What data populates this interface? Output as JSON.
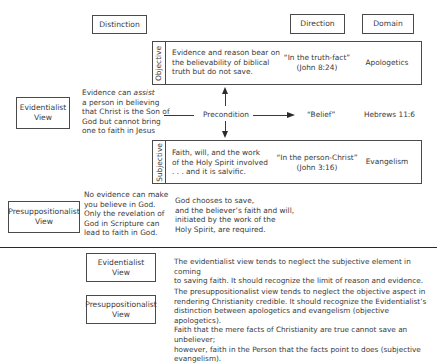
{
  "headers": {
    "distinction": "Distinction",
    "direction": "Direction",
    "domain": "Domain"
  },
  "objective": {
    "label": "Objective",
    "text": "Evidence and reason bear on\nthe believability of biblical\ntruth but do not save.",
    "direction": "“In the truth-fact”\n(John 8:24)",
    "domain": "Apologetics"
  },
  "subjective": {
    "label": "Subjective",
    "text": "Faith, will, and the work\nof the Holy Spirit involved\n. . . and it is salvific.",
    "direction": "“In the person-Christ”\n(John 3:16)",
    "domain": "Evangelism"
  },
  "middle": {
    "precondition": "Precondition",
    "belief": "“Belief”",
    "reference": "Hebrews 11:6"
  },
  "evidentialist": {
    "view_label": "Evidentialist\nView",
    "desc_pre": "Evidence can ",
    "desc_em": "assist",
    "desc_post": "\na person in believing\nthat Christ is the Son of\nGod but cannot bring\none to faith in Jesus"
  },
  "presuppositionalist": {
    "view_label": "Presuppositionalist\nView",
    "desc": "No evidence can make\nyou believe in God.\nOnly the revelation of\nGod in Scripture can\nlead to faith in God.",
    "god_text": "God chooses to save,\nand the believer’s faith and will,\ninitiated by the work of the\nHoly Spirit, are required."
  },
  "critique": {
    "evidentialist_label": "Evidentialist\nView",
    "evidentialist_text": "The evidentialist view tends to neglect the subjective element in coming\nto saving faith. It should recognize the limit of reason and evidence.",
    "presuppositionalist_label": "Presuppositionalist\nView",
    "presuppositionalist_text": "The presuppositionalist view tends to neglect the objective aspect in\nrendering Christianity credible. It should recognize the Evidentialist’s\ndistinction between apologetics and evangelism (objective apologetics).\nFaith that the mere facts of Christianity are true cannot save an unbeliever;\nhowever, faith in the Person that the facts point to does (subjective evangelism)."
  }
}
